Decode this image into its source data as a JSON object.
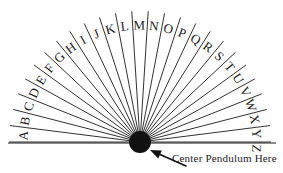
{
  "diagram": {
    "type": "radial-fan-chart",
    "background_color": "#ffffff",
    "stroke_color": "#1a1a1a",
    "hub": {
      "name": "center-hub",
      "cx": 140,
      "cy": 142,
      "radius": 11,
      "fill": "#111111"
    },
    "baseline": {
      "name": "baseline",
      "x1": 8,
      "x2": 276,
      "y": 143
    },
    "arc": {
      "radius": 131,
      "start_angle_deg": 180,
      "end_angle_deg": 0,
      "ray_count": 26
    },
    "letters": [
      "A",
      "B",
      "C",
      "D",
      "E",
      "F",
      "G",
      "H",
      "I",
      "J",
      "K",
      "L",
      "M",
      "N",
      "O",
      "P",
      "Q",
      "R",
      "S",
      "T",
      "U",
      "V",
      "W",
      "X",
      "Y",
      "Z"
    ],
    "letter_font_size": 13,
    "annotation": {
      "name": "center-pendulum-label",
      "text": "Center Pendulum Here",
      "x": 172,
      "y": 152,
      "font_size": 11
    },
    "arrow": {
      "name": "pointer-arrow",
      "tail_x": 186,
      "tail_y": 166,
      "tip_x": 150,
      "tip_y": 150
    }
  }
}
